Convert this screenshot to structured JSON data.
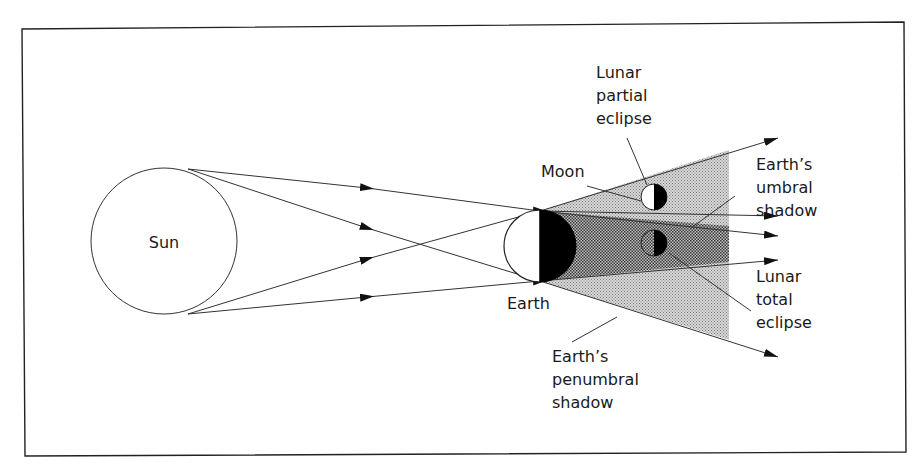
{
  "diagram": {
    "colors": {
      "line": "#333333",
      "penumbra": "#c4c4c4",
      "umbra": "#8a8a8a",
      "dark_side": "#000000",
      "background": "#ffffff"
    },
    "bodies": {
      "sun": {
        "label": "Sun"
      },
      "earth": {
        "label": "Earth"
      },
      "moon": {
        "label": "Moon"
      }
    },
    "labels": {
      "partial": [
        "Lunar",
        "partial",
        "eclipse"
      ],
      "umbral": [
        "Earth’s",
        "umbral",
        "shadow"
      ],
      "total": [
        "Lunar",
        "total",
        "eclipse"
      ],
      "penumbral": [
        "Earth’s",
        "penumbral",
        "shadow"
      ]
    }
  }
}
